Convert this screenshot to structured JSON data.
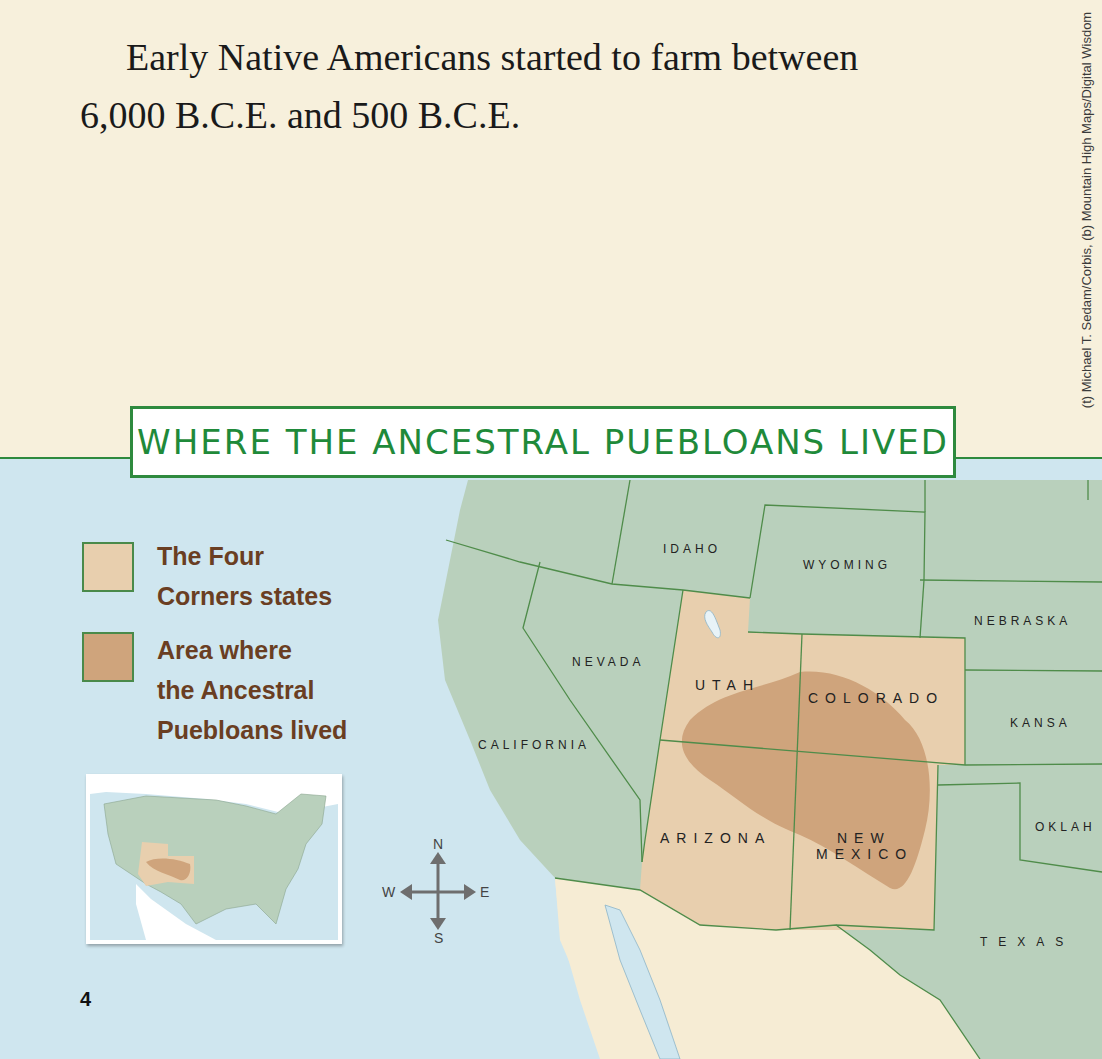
{
  "page": {
    "body_text_line1": "Early Native Americans started to farm between",
    "body_text_line2": "6,000 B.C.E. and 500 B.C.E.",
    "photo_credit": "(t) Michael T. Sedam/Corbis, (b) Mountain High Maps/Digital Wisdom",
    "page_number": "4"
  },
  "map": {
    "title": "WHERE THE ANCESTRAL PUEBLOANS LIVED",
    "legend": [
      {
        "label_line1": "The Four",
        "label_line2": "Corners states",
        "color": "#e8cfae"
      },
      {
        "label_line1": "Area where",
        "label_line2": "the Ancestral",
        "label_line3": "Puebloans lived",
        "color": "#cfa47c"
      }
    ],
    "compass": {
      "n": "N",
      "s": "S",
      "e": "E",
      "w": "W"
    },
    "states": {
      "idaho": "IDAHO",
      "wyoming": "WYOMING",
      "nebraska": "NEBRASKA",
      "nevada": "NEVADA",
      "utah": "UTAH",
      "colorado": "COLORADO",
      "kansas": "KANSA",
      "california": "CALIFORNIA",
      "arizona": "ARIZONA",
      "new_mexico_1": "NEW",
      "new_mexico_2": "MEXICO",
      "oklahoma": "OKLAH",
      "texas": "TEXAS"
    },
    "colors": {
      "water": "#cfe6ef",
      "land_other": "#b9d0bc",
      "four_corners": "#e8cfae",
      "puebloan_area": "#cfa47c",
      "mexico": "#f6ecd4",
      "border": "#4f8c4a",
      "title_green": "#1f8a3a",
      "legend_text": "#6a3e22"
    }
  }
}
